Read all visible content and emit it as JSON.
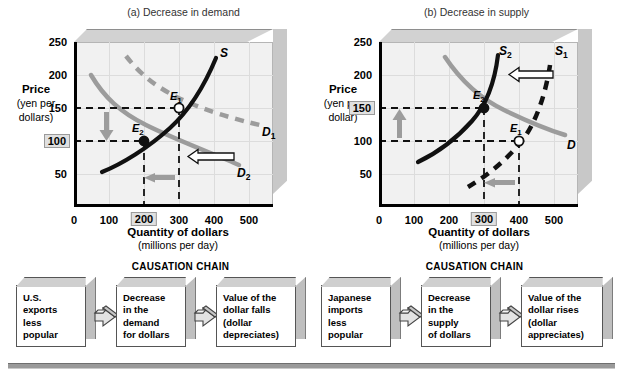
{
  "figure": {
    "panels": [
      {
        "id": "a",
        "title": "(a) Decrease in demand",
        "ylabel_main": "Price",
        "ylabel_sub1": "(yen per",
        "ylabel_sub2": "dollars)",
        "xlabel_main": "Quantity of dollars",
        "xlabel_sub": "(millions per day)",
        "yticks": [
          "50",
          "100",
          "150",
          "200",
          "250"
        ],
        "yticks_highlighted": [
          "100"
        ],
        "xticks": [
          "0",
          "100",
          "200",
          "300",
          "400",
          "500"
        ],
        "xticks_highlighted": [
          "200"
        ],
        "curve_labels": [
          {
            "name": "supply",
            "text": "S",
            "sub": ""
          },
          {
            "name": "demand-1",
            "text": "D",
            "sub": "1"
          },
          {
            "name": "demand-2",
            "text": "D",
            "sub": "2"
          }
        ],
        "equilibria": [
          {
            "name": "E1",
            "text": "E",
            "sub": "1",
            "marker": "hollow",
            "price": 150,
            "quantity": 300
          },
          {
            "name": "E2",
            "text": "E",
            "sub": "2",
            "marker": "filled",
            "price": 100,
            "quantity": 200
          }
        ],
        "shift_arrows": [
          {
            "name": "demand-shift-arrow",
            "direction": "left",
            "style": "outline"
          },
          {
            "name": "quantity-decrease-arrow",
            "direction": "left",
            "style": "solid-gray"
          },
          {
            "name": "price-decrease-arrow",
            "direction": "down",
            "style": "solid-gray"
          }
        ]
      },
      {
        "id": "b",
        "title": "(b) Decrease in supply",
        "ylabel_main": "Price",
        "ylabel_sub1": "(yen per",
        "ylabel_sub2": "dollar)",
        "xlabel_main": "Quantity of dollars",
        "xlabel_sub": "(millions per day)",
        "yticks": [
          "50",
          "100",
          "150",
          "200",
          "250"
        ],
        "yticks_highlighted": [
          "150"
        ],
        "xticks": [
          "0",
          "100",
          "200",
          "300",
          "400",
          "500"
        ],
        "xticks_highlighted": [
          "300"
        ],
        "curve_labels": [
          {
            "name": "supply-1",
            "text": "S",
            "sub": "1"
          },
          {
            "name": "supply-2",
            "text": "S",
            "sub": "2"
          },
          {
            "name": "demand",
            "text": "D",
            "sub": ""
          }
        ],
        "equilibria": [
          {
            "name": "E1",
            "text": "E",
            "sub": "1",
            "marker": "hollow",
            "price": 100,
            "quantity": 400
          },
          {
            "name": "E2",
            "text": "E",
            "sub": "2",
            "marker": "filled",
            "price": 150,
            "quantity": 300
          }
        ],
        "shift_arrows": [
          {
            "name": "supply-shift-arrow",
            "direction": "left",
            "style": "outline"
          },
          {
            "name": "quantity-decrease-arrow",
            "direction": "left",
            "style": "solid-gray"
          },
          {
            "name": "price-increase-arrow",
            "direction": "up",
            "style": "solid-gray"
          }
        ]
      }
    ]
  },
  "chains": [
    {
      "id": "a",
      "title": "CAUSATION CHAIN",
      "boxes": [
        "U.S.\nexports\nless\npopular",
        "Decrease\nin the\ndemand\nfor dollars",
        "Value of the\ndollar falls\n(dollar\ndepreciates)"
      ]
    },
    {
      "id": "b",
      "title": "CAUSATION CHAIN",
      "boxes": [
        "Japanese\nimports\nless\npopular",
        "Decrease\nin the\nsupply\nof dollars",
        "Value of the\ndollar rises\n(dollar\nappreciates)"
      ]
    }
  ],
  "chart_data": {
    "type": "line",
    "panels": [
      {
        "title": "(a) Decrease in demand",
        "xlabel": "Quantity of dollars (millions per day)",
        "ylabel": "Price (yen per dollars)",
        "xlim": [
          0,
          560
        ],
        "ylim": [
          0,
          260
        ],
        "xticks": [
          0,
          100,
          200,
          300,
          400,
          500
        ],
        "yticks": [
          50,
          100,
          150,
          200,
          250
        ],
        "grid": true,
        "series": [
          {
            "name": "S",
            "style": "solid-black",
            "points": [
              [
                80,
                55
              ],
              [
                160,
                85
              ],
              [
                230,
                125
              ],
              [
                290,
                160
              ],
              [
                340,
                205
              ],
              [
                375,
                230
              ]
            ]
          },
          {
            "name": "D1",
            "style": "dashed-gray",
            "points": [
              [
                145,
                230
              ],
              [
                200,
                185
              ],
              [
                265,
                150
              ],
              [
                340,
                120
              ],
              [
                430,
                95
              ],
              [
                505,
                80
              ]
            ]
          },
          {
            "name": "D2",
            "style": "solid-gray",
            "points": [
              [
                48,
                198
              ],
              [
                90,
                155
              ],
              [
                140,
                122
              ],
              [
                205,
                98
              ],
              [
                290,
                72
              ],
              [
                370,
                50
              ],
              [
                425,
                38
              ]
            ]
          }
        ],
        "equilibria": [
          {
            "label": "E1",
            "x": 300,
            "y": 150,
            "marker": "hollow"
          },
          {
            "label": "E2",
            "x": 200,
            "y": 100,
            "marker": "filled"
          }
        ]
      },
      {
        "title": "(b) Decrease in supply",
        "xlabel": "Quantity of dollars (millions per day)",
        "ylabel": "Price (yen per dollar)",
        "xlim": [
          0,
          560
        ],
        "ylim": [
          0,
          260
        ],
        "xticks": [
          0,
          100,
          200,
          300,
          400,
          500
        ],
        "yticks": [
          50,
          100,
          150,
          200,
          250
        ],
        "grid": true,
        "series": [
          {
            "name": "S1",
            "style": "dashed-black",
            "points": [
              [
                252,
                30
              ],
              [
                290,
                50
              ],
              [
                340,
                85
              ],
              [
                390,
                130
              ],
              [
                440,
                180
              ],
              [
                475,
                230
              ]
            ]
          },
          {
            "name": "S2",
            "style": "solid-black",
            "points": [
              [
                112,
                70
              ],
              [
                170,
                95
              ],
              [
                230,
                130
              ],
              [
                280,
                170
              ],
              [
                315,
                210
              ],
              [
                335,
                232
              ]
            ]
          },
          {
            "name": "D",
            "style": "solid-gray",
            "points": [
              [
                188,
                228
              ],
              [
                240,
                185
              ],
              [
                290,
                152
              ],
              [
                355,
                122
              ],
              [
                430,
                95
              ],
              [
                490,
                75
              ]
            ]
          }
        ],
        "equilibria": [
          {
            "label": "E2",
            "x": 300,
            "y": 150,
            "marker": "filled"
          },
          {
            "label": "E1",
            "x": 400,
            "y": 100,
            "marker": "hollow"
          }
        ]
      }
    ]
  }
}
